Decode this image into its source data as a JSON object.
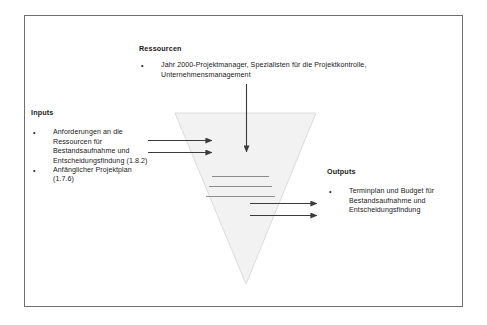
{
  "figure": {
    "frame": {
      "border_color": "#6e6e6e"
    },
    "funnel": {
      "name": "process-funnel",
      "fill_color": "#f2f2f2",
      "stroke_color": "#d9d9d9",
      "internal_line_color": "#8c8c8c",
      "internal_line_count": 3
    },
    "arrow_color": "#3b3b3b"
  },
  "ressourcen": {
    "heading": "Ressourcen",
    "bullets": [
      {
        "mark": "•",
        "text": "Jahr 2000-Projektmanager, Spezialisten für die Projektkontrolle, Unternehmensmanagement"
      }
    ]
  },
  "inputs": {
    "heading": "Inputs",
    "bullets": [
      {
        "mark": "•",
        "text": "Anforderungen an die Ressourcen für Bestandsaufnahme und Entscheidungsfindung (1.8.2)"
      },
      {
        "mark": "•",
        "text": "Anfänglicher Projektplan (1.7.6)"
      }
    ]
  },
  "outputs": {
    "heading": "Outputs",
    "bullets": [
      {
        "mark": "•",
        "text": "Terminplan und Budget für Bestandsaufnahme und Entscheidungsfindung"
      }
    ]
  }
}
